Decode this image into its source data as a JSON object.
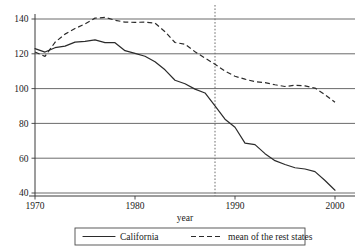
{
  "chart_data": {
    "type": "line",
    "title": "",
    "xlabel": "year",
    "ylabel": "",
    "xlim": [
      1970,
      2000
    ],
    "ylim": [
      40,
      140
    ],
    "grid": true,
    "xticks": [
      1970,
      1980,
      1990,
      2000
    ],
    "xtick_labels": [
      "1970",
      "1980",
      "1990",
      "2000"
    ],
    "yticks": [
      40,
      60,
      80,
      100,
      120,
      140
    ],
    "ytick_labels": [
      "40",
      "60",
      "80",
      "100",
      "120",
      "140"
    ],
    "legend_position": "below",
    "annotations": [
      {
        "name": "intervention-line",
        "type": "vline",
        "x": 1988,
        "style": "dotted"
      }
    ],
    "x": [
      1970,
      1971,
      1972,
      1973,
      1974,
      1975,
      1976,
      1977,
      1978,
      1979,
      1980,
      1981,
      1982,
      1983,
      1984,
      1985,
      1986,
      1987,
      1988,
      1989,
      1990,
      1991,
      1992,
      1993,
      1994,
      1995,
      1996,
      1997,
      1998,
      1999,
      2000
    ],
    "series": [
      {
        "name": "California",
        "style": "solid",
        "values": [
          123.0,
          121.0,
          123.5,
          124.4,
          126.7,
          127.1,
          128.0,
          126.4,
          126.4,
          121.8,
          120.2,
          118.6,
          115.4,
          110.8,
          104.8,
          102.8,
          99.7,
          97.5,
          90.1,
          82.4,
          77.8,
          68.7,
          67.8,
          62.6,
          58.6,
          56.4,
          54.5,
          53.8,
          52.3,
          47.2,
          41.6
        ]
      },
      {
        "name": "mean of the rest states",
        "style": "dashed",
        "values": [
          121.0,
          118.5,
          126.6,
          131.3,
          134.5,
          137.2,
          140.5,
          140.9,
          139.3,
          138.2,
          138.1,
          138.2,
          137.6,
          132.7,
          126.5,
          125.5,
          121.2,
          117.5,
          114.0,
          110.0,
          107.1,
          105.4,
          104.0,
          103.4,
          102.2,
          101.2,
          101.9,
          101.6,
          100.3,
          96.5,
          92.1
        ]
      }
    ]
  },
  "legend": {
    "entries": [
      {
        "label": "California",
        "style": "solid"
      },
      {
        "label": "mean of the rest states",
        "style": "dashed"
      }
    ]
  }
}
